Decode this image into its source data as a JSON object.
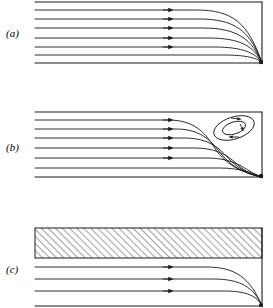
{
  "figure": {
    "width": 273,
    "height": 308,
    "background": "#ffffff",
    "stroke_color": "#1a1a1a",
    "label_color": "#000000"
  },
  "panels": [
    {
      "id": "a",
      "label": "(a)",
      "description": "Attached channel flow: horizontal streamlines bend down and converge at the lower-right corner",
      "box": {
        "x": 35,
        "y": 2,
        "width": 227,
        "height": 61
      },
      "walls": {
        "top": true,
        "right": true,
        "bottom": true,
        "left": false
      },
      "streamline_count": 6,
      "arrow_count": 5,
      "arrow_x": 170,
      "stagnation_point": {
        "x": 262,
        "y": 63
      },
      "has_eddy": false,
      "has_hatching": false
    },
    {
      "id": "b",
      "label": "(b)",
      "description": "Channel flow with a closed recirculating eddy in the upper-right corner",
      "box": {
        "x": 35,
        "y": 112,
        "width": 227,
        "height": 65
      },
      "walls": {
        "top": true,
        "right": true,
        "bottom": true,
        "left": false
      },
      "streamline_count": 6,
      "arrow_count": 5,
      "arrow_x": 170,
      "stagnation_point": {
        "x": 262,
        "y": 177
      },
      "has_eddy": true,
      "eddy": {
        "center_x": 234,
        "center_y": 128,
        "loops": 2,
        "outer_rx": 21,
        "outer_ry": 11,
        "inner_rx": 12,
        "inner_ry": 6,
        "tilt_deg": -18,
        "rotation": "clockwise",
        "arrow_count": 4
      },
      "has_hatching": false
    },
    {
      "id": "c",
      "label": "(c)",
      "description": "Channel flow beneath a hatched stagnant region; three streamlines converge at the lower-right corner",
      "box": {
        "x": 35,
        "y": 228,
        "width": 227,
        "height": 78
      },
      "walls": {
        "top": true,
        "right": true,
        "bottom": true,
        "left": false
      },
      "streamline_count": 3,
      "arrow_count": 3,
      "arrow_x": 170,
      "stagnation_point": {
        "x": 262,
        "y": 306
      },
      "has_eddy": false,
      "has_hatching": true,
      "hatching": {
        "x": 35,
        "y": 228,
        "width": 227,
        "height": 30,
        "angle_deg": 45,
        "spacing": 5,
        "direction": "lower-left to upper-right"
      }
    }
  ]
}
